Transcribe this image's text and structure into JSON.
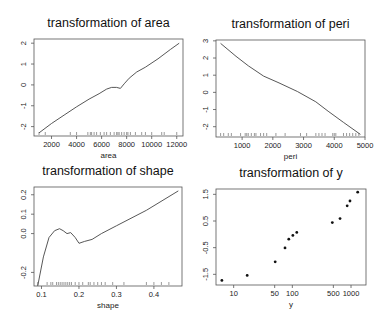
{
  "chart_data": [
    {
      "type": "line",
      "title": "transformation of area",
      "xlabel": "area",
      "ylabel": "",
      "xlim": [
        600,
        12500
      ],
      "ylim": [
        -2.45,
        2.2
      ],
      "xticks": [
        2000,
        4000,
        6000,
        8000,
        10000,
        12000
      ],
      "yticks": [
        -2,
        -1,
        0,
        1,
        2
      ],
      "grid": false,
      "x": [
        1000,
        2000,
        3000,
        4000,
        5000,
        5800,
        6400,
        6800,
        7200,
        7500,
        7800,
        8200,
        8800,
        9500,
        10500,
        11500,
        12200
      ],
      "y": [
        -2.3,
        -1.85,
        -1.45,
        -1.05,
        -0.68,
        -0.42,
        -0.2,
        -0.12,
        -0.12,
        -0.17,
        0.05,
        0.32,
        0.62,
        0.85,
        1.25,
        1.7,
        2.0
      ],
      "rug": [
        1000,
        1500,
        3500,
        4000,
        4900,
        5100,
        5200,
        5400,
        5600,
        5900,
        6200,
        6400,
        6700,
        7000,
        7200,
        7300,
        7400,
        7600,
        7800,
        8000,
        8100,
        8300,
        8700,
        9200,
        9500,
        10000,
        10800,
        11000,
        12000
      ]
    },
    {
      "type": "line",
      "title": "transformation of peri",
      "xlabel": "peri",
      "ylabel": "",
      "xlim": [
        150,
        5000
      ],
      "ylim": [
        -2.6,
        3.05
      ],
      "xticks": [
        1000,
        2000,
        3000,
        4000,
        5000
      ],
      "yticks": [
        -2,
        -1,
        0,
        1,
        2,
        3
      ],
      "grid": false,
      "x": [
        300,
        800,
        1200,
        1700,
        2200,
        2800,
        3400,
        3800,
        4300,
        4850
      ],
      "y": [
        2.85,
        2.1,
        1.55,
        0.95,
        0.55,
        0.05,
        -0.55,
        -1.1,
        -1.75,
        -2.45
      ],
      "rug": [
        300,
        400,
        550,
        650,
        950,
        1100,
        1150,
        1200,
        1300,
        1400,
        1450,
        1600,
        1700,
        1800,
        2100,
        2400,
        2900,
        3100,
        3400,
        3500,
        3600,
        3700,
        3950,
        4000,
        4050,
        4300,
        4400,
        4500,
        4600,
        4700,
        4800
      ]
    },
    {
      "type": "line",
      "title": "transformation of shape",
      "xlabel": "shape",
      "ylabel": "",
      "xlim": [
        0.08,
        0.475
      ],
      "ylim": [
        -0.27,
        0.24
      ],
      "xticks": [
        0.1,
        0.2,
        0.3,
        0.4
      ],
      "yticks": [
        -0.2,
        0.0,
        0.1,
        0.2
      ],
      "grid": false,
      "x": [
        0.09,
        0.105,
        0.12,
        0.135,
        0.148,
        0.158,
        0.168,
        0.178,
        0.19,
        0.2,
        0.215,
        0.235,
        0.26,
        0.3,
        0.38,
        0.465
      ],
      "y": [
        -0.27,
        -0.12,
        -0.02,
        0.015,
        0.025,
        0.015,
        0.0,
        0.005,
        -0.02,
        -0.05,
        -0.04,
        -0.03,
        0.0,
        0.04,
        0.12,
        0.22
      ],
      "rug": [
        0.09,
        0.115,
        0.125,
        0.13,
        0.14,
        0.145,
        0.15,
        0.155,
        0.16,
        0.165,
        0.17,
        0.175,
        0.18,
        0.19,
        0.2,
        0.21,
        0.225,
        0.23,
        0.24,
        0.25,
        0.26,
        0.27,
        0.29,
        0.32,
        0.38,
        0.4,
        0.42,
        0.44
      ]
    },
    {
      "type": "scatter",
      "title": "transformation of y",
      "xlabel": "y",
      "ylabel": "",
      "xscale": "log",
      "xlim": [
        5,
        1800
      ],
      "ylim": [
        -1.9,
        1.7
      ],
      "xticks": [
        10,
        50,
        100,
        500,
        1000
      ],
      "yticks": [
        -1.5,
        -0.5,
        0.5,
        1.5
      ],
      "grid": false,
      "x": [
        6.3,
        17,
        51,
        75,
        87,
        102,
        119,
        480,
        650,
        860,
        960,
        1300
      ],
      "y": [
        -1.73,
        -1.54,
        -1.03,
        -0.51,
        -0.18,
        -0.04,
        0.07,
        0.44,
        0.59,
        1.07,
        1.25,
        1.58
      ]
    }
  ],
  "panels": [
    {
      "title": "transformation of area",
      "xlabel": "area",
      "xtick_labels": [
        "2000",
        "4000",
        "6000",
        "8000",
        "10000",
        "12000"
      ],
      "ytick_labels": [
        "-2",
        "-1",
        "0",
        "1",
        "2"
      ]
    },
    {
      "title": "transformation of peri",
      "xlabel": "peri",
      "xtick_labels": [
        "1000",
        "2000",
        "3000",
        "4000",
        "5000"
      ],
      "ytick_labels": [
        "-2",
        "-1",
        "0",
        "1",
        "2",
        "3"
      ]
    },
    {
      "title": "transformation of shape",
      "xlabel": "shape",
      "xtick_labels": [
        "0.1",
        "0.2",
        "0.3",
        "0.4"
      ],
      "ytick_labels": [
        "-0.2",
        "0.0",
        "0.1",
        "0.2"
      ]
    },
    {
      "title": "transformation of y",
      "xlabel": "y",
      "xtick_labels": [
        "10",
        "50",
        "100",
        "500",
        "1000"
      ],
      "ytick_labels": [
        "-1.5",
        "-0.5",
        "0.5",
        "1.5"
      ]
    }
  ]
}
